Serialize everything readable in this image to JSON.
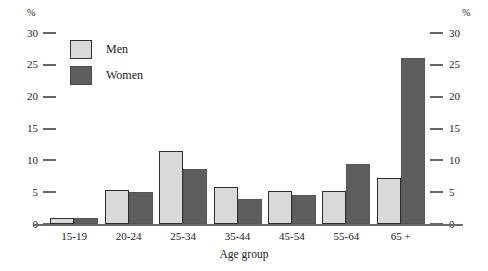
{
  "chart_data": {
    "type": "bar",
    "title": "",
    "xlabel": "Age group",
    "ylabel": "%",
    "ylabel_right": "%",
    "categories": [
      "15-19",
      "20-24",
      "25-34",
      "35-44",
      "45-54",
      "55-64",
      "65 +"
    ],
    "series": [
      {
        "name": "Men",
        "color": "#d9d9d9",
        "values": [
          1.0,
          5.3,
          11.4,
          5.8,
          5.2,
          5.2,
          7.3
        ]
      },
      {
        "name": "Women",
        "color": "#5e5e5e",
        "values": [
          1.0,
          5.0,
          8.6,
          3.9,
          4.5,
          9.5,
          26.0
        ]
      }
    ],
    "ylim": [
      0,
      30
    ],
    "yticks": [
      30,
      25,
      20,
      15,
      10,
      5,
      0
    ],
    "ytick_labels": [
      "30",
      "25",
      "20",
      "15",
      "10",
      "5",
      "0"
    ],
    "grid": false,
    "legend_position": "top-left",
    "axis_style": "dual-y-mirrored-ticks"
  },
  "axes": {
    "left_unit": "%",
    "right_unit": "%"
  },
  "legend": {
    "entries": [
      {
        "label": "Men"
      },
      {
        "label": "Women"
      }
    ]
  }
}
